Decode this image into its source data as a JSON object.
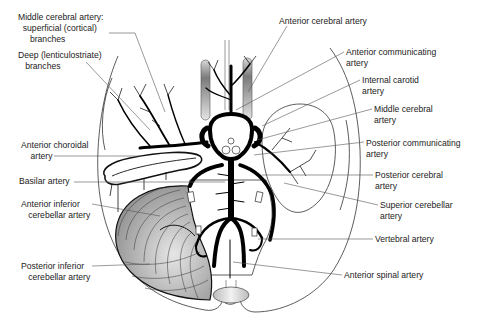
{
  "diagram": {
    "colors": {
      "artery": "#000000",
      "outline": "#333333",
      "leader": "#555555",
      "text": "#222222",
      "shade": "#9a9a9a"
    },
    "labels": [
      {
        "id": "mca-superficial",
        "lines": [
          "Middle cerebral artery:",
          "  superficial (cortical)",
          "     branches"
        ],
        "x": 18,
        "y": 12
      },
      {
        "id": "deep-branches",
        "lines": [
          "Deep (lenticulostriate)",
          "   branches"
        ],
        "x": 18,
        "y": 50
      },
      {
        "id": "anterior-cerebral",
        "lines": [
          "Anterior cerebral artery"
        ],
        "x": 279,
        "y": 16
      },
      {
        "id": "anterior-communicating",
        "lines": [
          "Anterior communicating",
          "artery"
        ],
        "x": 346,
        "y": 47
      },
      {
        "id": "internal-carotid",
        "lines": [
          "Internal carotid",
          "artery"
        ],
        "x": 362,
        "y": 75
      },
      {
        "id": "middle-cerebral",
        "lines": [
          "Middle cerebral",
          "artery"
        ],
        "x": 374,
        "y": 104
      },
      {
        "id": "posterior-communicating",
        "lines": [
          "Posterior communicating",
          "artery"
        ],
        "x": 366,
        "y": 138
      },
      {
        "id": "anterior-choroidal",
        "lines": [
          "Anterior choroidal",
          "    artery"
        ],
        "x": 21,
        "y": 140
      },
      {
        "id": "basilar",
        "lines": [
          "Basilar artery"
        ],
        "x": 19,
        "y": 176
      },
      {
        "id": "posterior-cerebral",
        "lines": [
          "Posterior cerebral",
          "artery"
        ],
        "x": 375,
        "y": 170
      },
      {
        "id": "anterior-inferior-cerebellar",
        "lines": [
          "Anterior inferior",
          "   cerebellar artery"
        ],
        "x": 21,
        "y": 199
      },
      {
        "id": "superior-cerebellar",
        "lines": [
          "Superior cerebellar",
          "artery"
        ],
        "x": 380,
        "y": 200
      },
      {
        "id": "vertebral",
        "lines": [
          "Vertebral artery"
        ],
        "x": 375,
        "y": 234
      },
      {
        "id": "posterior-inferior-cerebellar",
        "lines": [
          "Posterior inferior",
          "   cerebellar artery"
        ],
        "x": 21,
        "y": 261
      },
      {
        "id": "anterior-spinal",
        "lines": [
          "Anterior spinal artery"
        ],
        "x": 344,
        "y": 270
      }
    ],
    "leaders": [
      {
        "for": "mca-superficial",
        "points": [
          [
            109,
            33
          ],
          [
            135,
            33
          ],
          [
            165,
            112
          ]
        ]
      },
      {
        "for": "deep-branches",
        "points": [
          [
            86,
            62
          ],
          [
            150,
            130
          ]
        ]
      },
      {
        "for": "anterior-cerebral",
        "points": [
          [
            287,
            26
          ],
          [
            248,
            92
          ]
        ]
      },
      {
        "for": "anterior-communicating",
        "points": [
          [
            344,
            52
          ],
          [
            236,
            110
          ]
        ]
      },
      {
        "for": "internal-carotid",
        "points": [
          [
            360,
            80
          ],
          [
            262,
            126
          ]
        ]
      },
      {
        "for": "middle-cerebral",
        "points": [
          [
            372,
            109
          ],
          [
            257,
            140
          ]
        ]
      },
      {
        "for": "posterior-communicating",
        "points": [
          [
            364,
            142
          ],
          [
            254,
            155
          ]
        ]
      },
      {
        "for": "anterior-choroidal",
        "points": [
          [
            54,
            156
          ],
          [
            140,
            156
          ]
        ]
      },
      {
        "for": "basilar",
        "points": [
          [
            74,
            182
          ],
          [
            225,
            182
          ]
        ]
      },
      {
        "for": "posterior-cerebral",
        "points": [
          [
            373,
            175
          ],
          [
            262,
            175
          ]
        ]
      },
      {
        "for": "anterior-inferior-cerebellar",
        "points": [
          [
            92,
            204
          ],
          [
            160,
            216
          ]
        ]
      },
      {
        "for": "superior-cerebellar",
        "points": [
          [
            378,
            205
          ],
          [
            284,
            183
          ]
        ]
      },
      {
        "for": "vertebral",
        "points": [
          [
            373,
            239
          ],
          [
            258,
            239
          ]
        ]
      },
      {
        "for": "posterior-inferior-cerebellar",
        "points": [
          [
            92,
            266
          ],
          [
            150,
            264
          ]
        ]
      },
      {
        "for": "anterior-spinal",
        "points": [
          [
            342,
            275
          ],
          [
            233,
            262
          ]
        ]
      }
    ]
  }
}
